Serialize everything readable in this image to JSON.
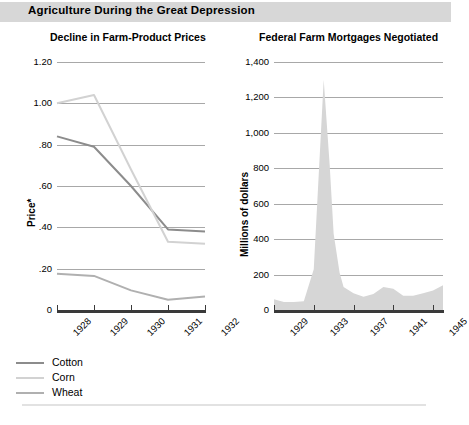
{
  "banner": {
    "title": "Agriculture During the Great Depression"
  },
  "legend": {
    "items": [
      {
        "label": "Cotton",
        "color": "#8c8c8c"
      },
      {
        "label": "Corn",
        "color": "#d2d2d2"
      },
      {
        "label": "Wheat",
        "color": "#b0b0b0"
      }
    ]
  },
  "chart_data": [
    {
      "type": "line",
      "title": "Decline in Farm-Product Prices",
      "xlabel": "",
      "ylabel": "Price*",
      "categories": [
        "1928",
        "1929",
        "1930",
        "1931",
        "1932"
      ],
      "x": [
        1928,
        1929,
        1930,
        1931,
        1932
      ],
      "xlim": [
        1928,
        1932
      ],
      "ylim": [
        0,
        1.2
      ],
      "yticks": [
        "0",
        ".20",
        ".40",
        ".60",
        ".80",
        "1.00",
        "1.20"
      ],
      "ytickvalues": [
        0,
        0.2,
        0.4,
        0.6,
        0.8,
        1.0,
        1.2
      ],
      "grid": true,
      "legend_position": "below",
      "series": [
        {
          "name": "Cotton",
          "color": "#8c8c8c",
          "values": [
            0.84,
            0.79,
            0.6,
            0.39,
            0.38
          ]
        },
        {
          "name": "Corn",
          "color": "#d2d2d2",
          "values": [
            1.0,
            1.04,
            0.68,
            0.33,
            0.32
          ]
        },
        {
          "name": "Wheat",
          "color": "#b0b0b0",
          "values": [
            0.175,
            0.165,
            0.095,
            0.05,
            0.065
          ]
        }
      ]
    },
    {
      "type": "area",
      "title": "Federal Farm Mortgages Negotiated",
      "xlabel": "",
      "ylabel": "Millions of dollars",
      "xticklabels": [
        "1929",
        "1933",
        "1937",
        "1941",
        "1945"
      ],
      "xtickvalues": [
        1929,
        1933,
        1937,
        1941,
        1945
      ],
      "xlim": [
        1929,
        1946
      ],
      "ylim": [
        0,
        1400
      ],
      "yticks": [
        "0",
        "200",
        "400",
        "600",
        "800",
        "1,000",
        "1,200",
        "1,400"
      ],
      "ytickvalues": [
        0,
        200,
        400,
        600,
        800,
        1000,
        1200,
        1400
      ],
      "grid": true,
      "fill_color": "#d6d6d6",
      "x": [
        1929,
        1930,
        1931,
        1932,
        1933,
        1934,
        1934.6,
        1935,
        1935.6,
        1936,
        1937,
        1938,
        1939,
        1940,
        1941,
        1942,
        1943,
        1944,
        1945,
        1946
      ],
      "values": [
        60,
        45,
        45,
        50,
        230,
        1300,
        820,
        430,
        210,
        130,
        95,
        75,
        90,
        130,
        120,
        80,
        80,
        95,
        110,
        140
      ]
    }
  ]
}
